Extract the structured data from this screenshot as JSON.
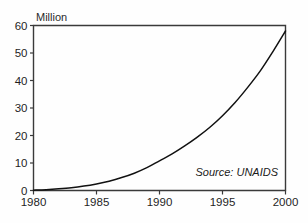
{
  "chart_data": {
    "type": "line",
    "title": "",
    "subtitle": "",
    "xlabel": "",
    "ylabel": "Million",
    "unit_label": "Million",
    "xlim": [
      1980,
      2000
    ],
    "ylim": [
      0,
      60
    ],
    "grid": false,
    "legend": null,
    "legend_position": "none",
    "annotation": "Source: UNAIDS",
    "x_ticks": [
      1980,
      1985,
      1990,
      1995,
      2000
    ],
    "x_tick_labels": [
      "1980",
      "1985",
      "1990",
      "1995",
      "2000"
    ],
    "y_ticks": [
      0,
      10,
      20,
      30,
      40,
      50,
      60
    ],
    "y_tick_labels": [
      "0",
      "10",
      "20",
      "30",
      "40",
      "50",
      "60"
    ],
    "series": [
      {
        "name": "People living with HIV/AIDS",
        "color": "#111111",
        "x": [
          1980,
          1981,
          1982,
          1983,
          1984,
          1985,
          1986,
          1987,
          1988,
          1989,
          1990,
          1991,
          1992,
          1993,
          1994,
          1995,
          1996,
          1997,
          1998,
          1999,
          2000
        ],
        "values": [
          0.1,
          0.3,
          0.6,
          1.0,
          1.6,
          2.4,
          3.4,
          4.7,
          6.3,
          8.3,
          10.8,
          13.3,
          16.2,
          19.4,
          23.0,
          27.2,
          32.0,
          37.5,
          43.5,
          50.5,
          58.0
        ]
      }
    ]
  },
  "axis_colors": {
    "frame": "#3a3a3a",
    "line": "#111111",
    "text": "#1f1f1f",
    "background": "#fefefe"
  }
}
